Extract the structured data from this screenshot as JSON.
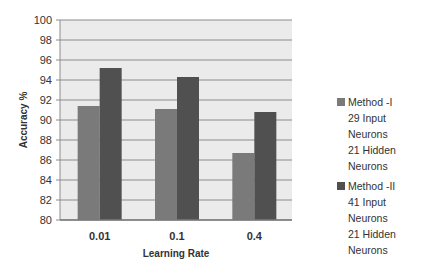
{
  "chart_data": {
    "type": "bar",
    "title": "",
    "xlabel": "Learning Rate",
    "ylabel": "Accuracy %",
    "ylim": [
      80,
      100
    ],
    "yticks": [
      80,
      82,
      84,
      86,
      88,
      90,
      92,
      94,
      96,
      98,
      100
    ],
    "grid": true,
    "legend_position": "right",
    "categories": [
      "0.01",
      "0.1",
      "0.4"
    ],
    "series": [
      {
        "name": "Method -I",
        "details": [
          "29 Input Neurons",
          "21 Hidden Neurons"
        ],
        "color": "#7a7a7a",
        "values": [
          91.4,
          91.1,
          86.7
        ]
      },
      {
        "name": "Method -II",
        "details": [
          "41 Input Neurons",
          "21 Hidden Neurons"
        ],
        "color": "#505050",
        "values": [
          95.2,
          94.3,
          90.8
        ]
      }
    ]
  },
  "colors": {
    "plot_bg": "#ebebeb",
    "grid": "#8c8c8c"
  }
}
